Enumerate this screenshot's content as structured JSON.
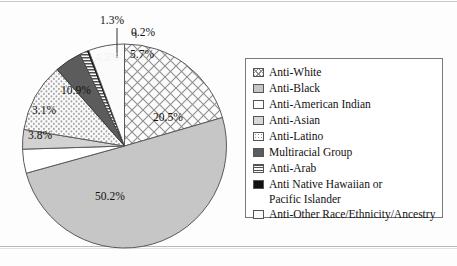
{
  "chart_data": {
    "type": "pie",
    "title": "",
    "subtitle": "",
    "xlabel": "",
    "ylabel": "",
    "units": "percent",
    "legend_position": "right",
    "grid": false,
    "start_angle_deg": 0,
    "direction": "clockwise",
    "categories": [
      "Anti-White",
      "Anti-Black",
      "Anti-American Indian",
      "Anti-Asian",
      "Anti-Latino",
      "Multiracial Group",
      "Anti-Arab",
      "Anti Native Hawaiian or Pacific Islander",
      "Anti-Other Race/Ethnicity/Ancestry"
    ],
    "values": [
      20.5,
      50.2,
      3.8,
      3.1,
      10.9,
      4.3,
      1.3,
      0.2,
      5.7
    ],
    "slices": [
      {
        "name": "Anti-White",
        "label": "20.5%",
        "value": 20.5,
        "pattern": "crosshatch-diagonal",
        "fill": "#fbfbfb",
        "stroke": "#5a5a5a",
        "label_x": 153,
        "label_y": 111,
        "callout": false
      },
      {
        "name": "Anti-Black",
        "label": "50.2%",
        "value": 50.2,
        "pattern": "solid",
        "fill": "#c6c6c6",
        "stroke": "#5a5a5a",
        "label_x": 95,
        "label_y": 190,
        "callout": false
      },
      {
        "name": "Anti-American Indian",
        "label": "3.8%",
        "value": 3.8,
        "pattern": "solid",
        "fill": "#ffffff",
        "stroke": "#5a5a5a",
        "label_x": 28,
        "label_y": 129,
        "callout": false
      },
      {
        "name": "Anti-Asian",
        "label": "3.1%",
        "value": 3.1,
        "pattern": "solid",
        "fill": "#d2d2d2",
        "stroke": "#5a5a5a",
        "label_x": 32,
        "label_y": 104,
        "callout": false
      },
      {
        "name": "Anti-Latino",
        "label": "10.9%",
        "value": 10.9,
        "pattern": "dots",
        "fill": "#fafafa",
        "stroke": "#5a5a5a",
        "label_x": 61,
        "label_y": 84,
        "callout": false
      },
      {
        "name": "Multiracial Group",
        "label": "4.3%",
        "value": 4.3,
        "pattern": "solid",
        "fill": "#5c5c5c",
        "stroke": "#3a3a3a",
        "label_x": 95,
        "label_y": 51,
        "callout": false
      },
      {
        "name": "Anti-Arab",
        "label": "1.3%",
        "value": 1.3,
        "pattern": "horizontal-lines",
        "fill": "#f2f2f2",
        "stroke": "#4a4a4a",
        "label_x": 100,
        "label_y": 14,
        "callout": true
      },
      {
        "name": "Anti Native Hawaiian or Pacific Islander",
        "label": "0.2%",
        "value": 0.2,
        "pattern": "solid",
        "fill": "#111111",
        "stroke": "#111111",
        "label_x": 131,
        "label_y": 26,
        "callout": true
      },
      {
        "name": "Anti-Other Race/Ethnicity/Ancestry",
        "label": "5.7%",
        "value": 5.7,
        "pattern": "solid",
        "fill": "#fbfbfb",
        "stroke": "#5a5a5a",
        "label_x": 130,
        "label_y": 48,
        "callout": false
      }
    ]
  },
  "legend": {
    "items": [
      {
        "label": "Anti-White",
        "label_line2": "",
        "swatch": "crosshatch-diagonal"
      },
      {
        "label": "Anti-Black",
        "label_line2": "",
        "swatch": "solid-medium-gray"
      },
      {
        "label": "Anti-American Indian",
        "label_line2": "",
        "swatch": "solid-white"
      },
      {
        "label": "Anti-Asian",
        "label_line2": "",
        "swatch": "solid-light-gray"
      },
      {
        "label": "Anti-Latino",
        "label_line2": "",
        "swatch": "dots"
      },
      {
        "label": "Multiracial Group",
        "label_line2": "",
        "swatch": "solid-dark-gray"
      },
      {
        "label": "Anti-Arab",
        "label_line2": "",
        "swatch": "horizontal-lines"
      },
      {
        "label": "Anti Native Hawaiian or",
        "label_line2": "Pacific Islander",
        "swatch": "solid-black"
      },
      {
        "label": "Anti-Other Race/Ethnicity/Ancestry",
        "label_line2": "",
        "swatch": "solid-offwhite"
      }
    ]
  }
}
